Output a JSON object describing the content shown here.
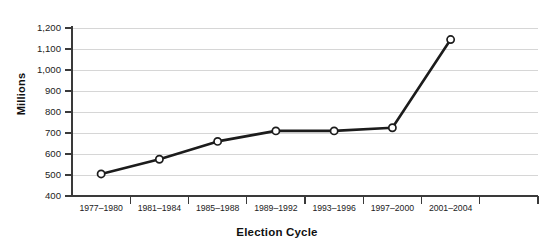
{
  "chart_data": {
    "type": "line",
    "title": "",
    "xlabel": "Election Cycle",
    "ylabel": "Millions",
    "categories": [
      "1977–1980",
      "1981–1984",
      "1985–1988",
      "1989–1992",
      "1993–1996",
      "1997–2000",
      "2001–2004"
    ],
    "x": [
      "1977–1980",
      "1981–1984",
      "1985–1988",
      "1989–1992",
      "1993–1996",
      "1997–2000",
      "2001–2004"
    ],
    "values": [
      505,
      575,
      660,
      710,
      710,
      725,
      1145
    ],
    "series": [
      {
        "name": "Millions",
        "values": [
          505,
          575,
          660,
          710,
          710,
          725,
          1145
        ]
      }
    ],
    "ylim": [
      400,
      1200
    ],
    "yticks": [
      400,
      500,
      600,
      700,
      800,
      900,
      1000,
      1100,
      1200
    ],
    "ytick_labels": [
      "400",
      "500",
      "600",
      "700",
      "800",
      "900",
      "1,000",
      "1,100",
      "1,200"
    ],
    "grid": true,
    "legend": "none",
    "marker": "circle-open",
    "line_color": "#1c1c1c",
    "marker_fill": "#ffffff",
    "grid_color": "#d6d6d6",
    "axis_color": "#3a3a3a",
    "background": "#ffffff"
  },
  "axis_titles": {
    "y": "Millions",
    "x": "Election Cycle"
  }
}
